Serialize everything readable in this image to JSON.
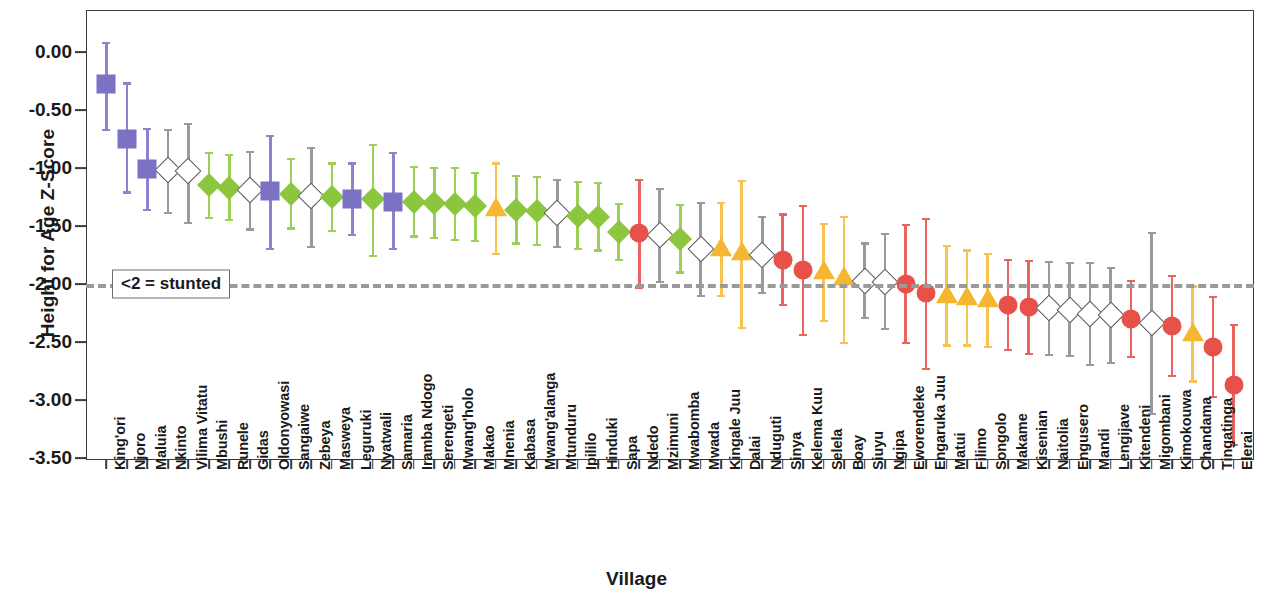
{
  "chart_data": {
    "type": "scatter",
    "title": "",
    "xlabel": "Village",
    "ylabel": "Height for Age Z-Score",
    "ylim": [
      -3.5,
      0.25
    ],
    "ytick_labels": [
      "0.00",
      "-0.50",
      "-1.00",
      "-1.50",
      "-2.00",
      "-2.50",
      "-3.00",
      "-3.50"
    ],
    "ytick_values": [
      0.0,
      -0.5,
      -1.0,
      -1.5,
      -2.0,
      -2.5,
      -3.0,
      -3.5
    ],
    "grid": false,
    "legend": "none",
    "annotations": [
      {
        "text": "<2 = stunted",
        "y": -2.0,
        "style": "dashed-reference-line"
      }
    ],
    "marker_legend": {
      "purple-square": "#7b72c4",
      "green-diamond": "#8cc63e",
      "open-diamond": "#ffffff",
      "amber-triangle": "#f5b731",
      "red-circle": "#e8504a"
    },
    "categories": [
      "King'ori",
      "Njoro",
      "Maluia",
      "Nkinto",
      "Vilima Vitatu",
      "Mbushi",
      "Runele",
      "Gidas",
      "Oldonyowasi",
      "Sangaiwe",
      "Zebeya",
      "Masweya",
      "Leguruki",
      "Nyatwali",
      "Samaria",
      "Iramba Ndogo",
      "Serengeti",
      "Mwang'holo",
      "Makao",
      "Mnenia",
      "Kabasa",
      "Mwang'alanga",
      "Mtunduru",
      "Ipililo",
      "Hinduki",
      "Sapa",
      "Ndedo",
      "Mzimuni",
      "Mwabomba",
      "Mwada",
      "Kingale Juu",
      "Dalai",
      "Nduguti",
      "Sinya",
      "Kelema Kuu",
      "Selela",
      "Boay",
      "Siuyu",
      "Ngipa",
      "Eworendeke",
      "Engaruka Juu",
      "Matui",
      "Filimo",
      "Songolo",
      "Makame",
      "Kisenian",
      "Naitolia",
      "Engusero",
      "Mandi",
      "Lengijave",
      "Kitendeni",
      "Migombani",
      "Kimokouwa",
      "Chandama",
      "Tingatinga",
      "Elerai"
    ],
    "points": [
      {
        "village": "King'ori",
        "value": -0.28,
        "low": -0.67,
        "high": 0.08,
        "marker": "purple-square"
      },
      {
        "village": "Njoro",
        "value": -0.75,
        "low": -1.21,
        "high": -0.27,
        "marker": "purple-square"
      },
      {
        "village": "Maluia",
        "value": -1.01,
        "low": -1.36,
        "high": -0.66,
        "marker": "purple-square"
      },
      {
        "village": "Nkinto",
        "value": -1.02,
        "low": -1.39,
        "high": -0.67,
        "marker": "open-diamond"
      },
      {
        "village": "Vilima Vitatu",
        "value": -1.03,
        "low": -1.47,
        "high": -0.62,
        "marker": "open-diamond"
      },
      {
        "village": "Mbushi",
        "value": -1.15,
        "low": -1.43,
        "high": -0.87,
        "marker": "green-diamond"
      },
      {
        "village": "Runele",
        "value": -1.17,
        "low": -1.45,
        "high": -0.89,
        "marker": "green-diamond"
      },
      {
        "village": "Gidas",
        "value": -1.19,
        "low": -1.53,
        "high": -0.86,
        "marker": "open-diamond"
      },
      {
        "village": "Oldonyowasi",
        "value": -1.2,
        "low": -1.7,
        "high": -0.72,
        "marker": "purple-square"
      },
      {
        "village": "Sangaiwe",
        "value": -1.22,
        "low": -1.52,
        "high": -0.92,
        "marker": "green-diamond"
      },
      {
        "village": "Zebeya",
        "value": -1.24,
        "low": -1.68,
        "high": -0.83,
        "marker": "open-diamond"
      },
      {
        "village": "Masweya",
        "value": -1.25,
        "low": -1.54,
        "high": -0.96,
        "marker": "green-diamond"
      },
      {
        "village": "Leguruki",
        "value": -1.27,
        "low": -1.58,
        "high": -0.96,
        "marker": "purple-square"
      },
      {
        "village": "Nyatwali",
        "value": -1.27,
        "low": -1.76,
        "high": -0.8,
        "marker": "green-diamond"
      },
      {
        "village": "Samaria",
        "value": -1.29,
        "low": -1.7,
        "high": -0.87,
        "marker": "purple-square"
      },
      {
        "village": "Iramba Ndogo",
        "value": -1.29,
        "low": -1.59,
        "high": -0.99,
        "marker": "green-diamond"
      },
      {
        "village": "Serengeti",
        "value": -1.3,
        "low": -1.6,
        "high": -1.0,
        "marker": "green-diamond"
      },
      {
        "village": "Mwang'holo",
        "value": -1.31,
        "low": -1.62,
        "high": -1.0,
        "marker": "green-diamond"
      },
      {
        "village": "Makao",
        "value": -1.33,
        "low": -1.63,
        "high": -1.04,
        "marker": "green-diamond"
      },
      {
        "village": "Mnenia",
        "value": -1.35,
        "low": -1.74,
        "high": -0.96,
        "marker": "amber-triangle"
      },
      {
        "village": "Kabasa",
        "value": -1.36,
        "low": -1.65,
        "high": -1.07,
        "marker": "green-diamond"
      },
      {
        "village": "Mwang'alanga",
        "value": -1.37,
        "low": -1.66,
        "high": -1.08,
        "marker": "green-diamond"
      },
      {
        "village": "Mtunduru",
        "value": -1.39,
        "low": -1.68,
        "high": -1.1,
        "marker": "open-diamond"
      },
      {
        "village": "Ipililo",
        "value": -1.41,
        "low": -1.7,
        "high": -1.12,
        "marker": "green-diamond"
      },
      {
        "village": "Hinduki",
        "value": -1.42,
        "low": -1.71,
        "high": -1.13,
        "marker": "green-diamond"
      },
      {
        "village": "Sapa",
        "value": -1.55,
        "low": -1.79,
        "high": -1.31,
        "marker": "green-diamond"
      },
      {
        "village": "Ndedo",
        "value": -1.56,
        "low": -2.03,
        "high": -1.1,
        "marker": "red-circle"
      },
      {
        "village": "Mzimuni",
        "value": -1.58,
        "low": -1.98,
        "high": -1.18,
        "marker": "open-diamond"
      },
      {
        "village": "Mwabomba",
        "value": -1.61,
        "low": -1.9,
        "high": -1.32,
        "marker": "green-diamond"
      },
      {
        "village": "Mwada",
        "value": -1.7,
        "low": -2.1,
        "high": -1.3,
        "marker": "open-diamond"
      },
      {
        "village": "Kingale Juu",
        "value": -1.7,
        "low": -2.1,
        "high": -1.3,
        "marker": "amber-triangle"
      },
      {
        "village": "Dalai",
        "value": -1.73,
        "low": -2.38,
        "high": -1.11,
        "marker": "amber-triangle"
      },
      {
        "village": "Nduguti",
        "value": -1.75,
        "low": -2.08,
        "high": -1.42,
        "marker": "open-diamond"
      },
      {
        "village": "Sinya",
        "value": -1.79,
        "low": -2.18,
        "high": -1.4,
        "marker": "red-circle"
      },
      {
        "village": "Kelema Kuu",
        "value": -1.88,
        "low": -2.44,
        "high": -1.33,
        "marker": "red-circle"
      },
      {
        "village": "Selela",
        "value": -1.9,
        "low": -2.32,
        "high": -1.48,
        "marker": "amber-triangle"
      },
      {
        "village": "Boay",
        "value": -1.95,
        "low": -2.51,
        "high": -1.42,
        "marker": "amber-triangle"
      },
      {
        "village": "Siuyu",
        "value": -1.97,
        "low": -2.29,
        "high": -1.65,
        "marker": "open-diamond"
      },
      {
        "village": "Ngipa",
        "value": -1.98,
        "low": -2.39,
        "high": -1.57,
        "marker": "open-diamond"
      },
      {
        "village": "Eworendeke",
        "value": -2.0,
        "low": -2.51,
        "high": -1.49,
        "marker": "red-circle"
      },
      {
        "village": "Engaruka Juu",
        "value": -2.08,
        "low": -2.73,
        "high": -1.44,
        "marker": "red-circle"
      },
      {
        "village": "Matui",
        "value": -2.1,
        "low": -2.53,
        "high": -1.67,
        "marker": "amber-triangle"
      },
      {
        "village": "Filimo",
        "value": -2.12,
        "low": -2.53,
        "high": -1.71,
        "marker": "amber-triangle"
      },
      {
        "village": "Songolo",
        "value": -2.14,
        "low": -2.54,
        "high": -1.74,
        "marker": "amber-triangle"
      },
      {
        "village": "Makame",
        "value": -2.18,
        "low": -2.57,
        "high": -1.79,
        "marker": "red-circle"
      },
      {
        "village": "Kisenian",
        "value": -2.2,
        "low": -2.6,
        "high": -1.8,
        "marker": "red-circle"
      },
      {
        "village": "Naitolia",
        "value": -2.21,
        "low": -2.61,
        "high": -1.81,
        "marker": "open-diamond"
      },
      {
        "village": "Engusero",
        "value": -2.22,
        "low": -2.62,
        "high": -1.82,
        "marker": "open-diamond"
      },
      {
        "village": "Mandi",
        "value": -2.26,
        "low": -2.7,
        "high": -1.82,
        "marker": "open-diamond"
      },
      {
        "village": "Lengijave",
        "value": -2.27,
        "low": -2.68,
        "high": -1.86,
        "marker": "open-diamond"
      },
      {
        "village": "Kitendeni",
        "value": -2.3,
        "low": -2.63,
        "high": -1.97,
        "marker": "red-circle"
      },
      {
        "village": "Migombani",
        "value": -2.34,
        "low": -3.12,
        "high": -1.56,
        "marker": "open-diamond"
      },
      {
        "village": "Kimokouwa",
        "value": -2.36,
        "low": -2.79,
        "high": -1.93,
        "marker": "red-circle"
      },
      {
        "village": "Chandama",
        "value": -2.43,
        "low": -2.84,
        "high": -2.02,
        "marker": "amber-triangle"
      },
      {
        "village": "Tingatinga",
        "value": -2.54,
        "low": -2.97,
        "high": -2.11,
        "marker": "red-circle"
      },
      {
        "village": "Elerai",
        "value": -2.87,
        "low": -3.39,
        "high": -2.35,
        "marker": "red-circle"
      }
    ]
  }
}
